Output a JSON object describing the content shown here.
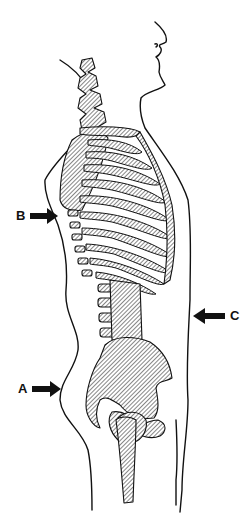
{
  "figure": {
    "labels": [
      {
        "id": "A",
        "text": "A",
        "points_to": "buttock / lower back curve",
        "direction": "right"
      },
      {
        "id": "B",
        "text": "B",
        "points_to": "upper back / thoracic curve",
        "direction": "right"
      },
      {
        "id": "C",
        "text": "C",
        "points_to": "abdomen",
        "direction": "left"
      }
    ],
    "colors": {
      "ink": "#111111",
      "background": "#ffffff"
    }
  }
}
